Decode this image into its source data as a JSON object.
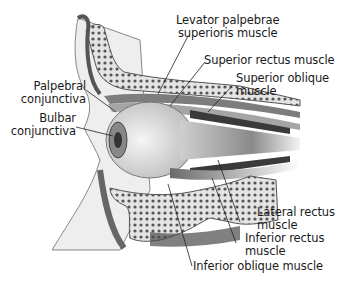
{
  "figure": {
    "colors": {
      "background": "#ffffff",
      "bone": "#d9d9d9",
      "bone_pores": "#5a5a5a",
      "muscle": "#9a9a9a",
      "muscle_dark": "#3c3c3c",
      "skin": "#e6e6e6",
      "leader_line": "#222222",
      "label_text": "#1a1a1a"
    }
  },
  "labels": {
    "levator": [
      "Levator palpebrae",
      "superioris muscle"
    ],
    "superior_rectus": [
      "Superior rectus muscle"
    ],
    "superior_oblique": [
      "Superior oblique",
      "muscle"
    ],
    "palpebral": [
      "Palpebral",
      "conjunctiva"
    ],
    "bulbar": [
      "Bulbar",
      "conjunctiva"
    ],
    "lateral_rectus": [
      "Lateral rectus",
      "muscle"
    ],
    "inferior_rectus": [
      "Inferior rectus",
      "muscle"
    ],
    "inferior_oblique": [
      "Inferior oblique muscle"
    ]
  }
}
